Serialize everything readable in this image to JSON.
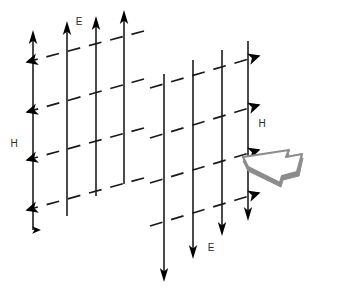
{
  "figure": {
    "width": 344,
    "height": 291,
    "background_color": "#ffffff"
  },
  "colors": {
    "solid_line": "#2b2b2b",
    "dashed_line": "#1a1a1a",
    "arrowhead": "#000000",
    "block_arrow_stroke": "#808080",
    "block_arrow_fill": "#ffffff",
    "block_arrow_shade": "#8c8c8c",
    "label": "#2b2b2b"
  },
  "left_group": {
    "name": "left-field-cluster",
    "e_label": "E",
    "h_label": "H",
    "e_label_pos": {
      "x": 79,
      "y": 25
    },
    "h_label_pos": {
      "x": 14,
      "y": 147
    },
    "e_direction": "up",
    "h_direction": "left",
    "solid_lines": [
      {
        "x_top": 33,
        "y_top": 36,
        "x_bottom": 33,
        "y_bottom": 230
      },
      {
        "x_top": 67,
        "y_top": 27,
        "x_bottom": 67,
        "y_bottom": 216
      },
      {
        "x_top": 96,
        "y_top": 22,
        "x_bottom": 96,
        "y_bottom": 196
      },
      {
        "x_top": 124,
        "y_top": 16,
        "x_bottom": 124,
        "y_bottom": 184
      }
    ],
    "dashed_lines": [
      {
        "x1": 23,
        "y1": 63,
        "x2": 144,
        "y2": 31
      },
      {
        "x1": 23,
        "y1": 113,
        "x2": 144,
        "y2": 79
      },
      {
        "x1": 23,
        "y1": 161,
        "x2": 144,
        "y2": 128
      },
      {
        "x1": 23,
        "y1": 211,
        "x2": 144,
        "y2": 178
      }
    ]
  },
  "right_group": {
    "name": "right-field-cluster",
    "e_label": "E",
    "h_label": "H",
    "e_label_pos": {
      "x": 211,
      "y": 251
    },
    "h_label_pos": {
      "x": 262,
      "y": 127
    },
    "e_direction": "down",
    "h_direction": "right",
    "solid_lines": [
      {
        "x_top": 164,
        "y_top": 74,
        "x_bottom": 164,
        "y_bottom": 280
      },
      {
        "x_top": 193,
        "y_top": 60,
        "x_bottom": 193,
        "y_bottom": 257
      },
      {
        "x_top": 222,
        "y_top": 50,
        "x_bottom": 222,
        "y_bottom": 234
      },
      {
        "x_top": 248,
        "y_top": 41,
        "x_bottom": 248,
        "y_bottom": 219
      }
    ],
    "dashed_lines": [
      {
        "x1": 150,
        "y1": 88,
        "x2": 262,
        "y2": 55
      },
      {
        "x1": 150,
        "y1": 138,
        "x2": 262,
        "y2": 104
      },
      {
        "x1": 150,
        "y1": 183,
        "x2": 262,
        "y2": 149
      },
      {
        "x1": 150,
        "y1": 226,
        "x2": 262,
        "y2": 192
      }
    ]
  },
  "propagation_arrow": {
    "name": "propagation-block-arrow",
    "label": "",
    "direction": "right",
    "style": "3d-block-arrow-outline"
  }
}
